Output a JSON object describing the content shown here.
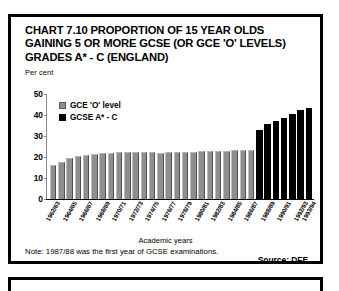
{
  "title": {
    "line1": "CHART 7.10 PROPORTION OF 15 YEAR OLDS",
    "line2": "GAINING 5 OR MORE GCSE (OR GCE 'O' LEVELS)",
    "line3": "GRADES A* - C (ENGLAND)"
  },
  "axis_unit_label": "Per cent",
  "x_axis_title": "Academic years",
  "note": "Note: 1987/88 was the first year of GCSE examinations.",
  "source": "Source: DFE",
  "legend": {
    "items": [
      {
        "label": "GCE 'O' level",
        "color": "#8e8e8e",
        "key": "gce"
      },
      {
        "label": "GCSE A* - C",
        "color": "#000000",
        "key": "gcse"
      }
    ]
  },
  "chart_data": {
    "type": "bar",
    "title": "CHART 7.10 PROPORTION OF 15 YEAR OLDS GAINING 5 OR MORE GCSE (OR GCE 'O' LEVELS) GRADES A* - C (ENGLAND)",
    "xlabel": "Academic years",
    "ylabel": "Per cent",
    "ylim": [
      0,
      50
    ],
    "yticks": [
      0,
      10,
      20,
      30,
      40,
      50
    ],
    "grid": false,
    "legend_position": "upper-left-inside",
    "categories": [
      "1962/63",
      "1963/64",
      "1964/65",
      "1965/66",
      "1966/67",
      "1967/68",
      "1968/69",
      "1969/70",
      "1970/71",
      "1971/72",
      "1972/73",
      "1973/74",
      "1974/75",
      "1975/76",
      "1976/77",
      "1977/78",
      "1978/79",
      "1979/80",
      "1980/81",
      "1981/82",
      "1982/83",
      "1983/84",
      "1984/85",
      "1985/86",
      "1986/87",
      "1987/88",
      "1988/89",
      "1989/90",
      "1990/91",
      "1991/92",
      "1992/93",
      "1993/94"
    ],
    "tick_labels_shown": [
      "1962/63",
      "1964/65",
      "1966/67",
      "1968/69",
      "1970/71",
      "1972/73",
      "1974/75",
      "1976/77",
      "1978/79",
      "1980/81",
      "1982/83",
      "1984/85",
      "1986/87",
      "1988/89",
      "1990/91",
      "1992/93",
      "1993/94"
    ],
    "series": [
      {
        "name": "GCE 'O' level",
        "color": "#8e8e8e",
        "values": [
          16.0,
          17.8,
          19.4,
          20.4,
          21.0,
          21.4,
          21.9,
          22.1,
          22.2,
          22.2,
          22.3,
          22.3,
          22.2,
          22.0,
          22.2,
          22.3,
          22.4,
          22.6,
          22.8,
          23.0,
          23.1,
          23.0,
          23.2,
          23.2,
          23.2,
          null,
          null,
          null,
          null,
          null,
          null,
          null
        ]
      },
      {
        "name": "GCSE A* - C",
        "color": "#000000",
        "values": [
          null,
          null,
          null,
          null,
          null,
          null,
          null,
          null,
          null,
          null,
          null,
          null,
          null,
          null,
          null,
          null,
          null,
          null,
          null,
          null,
          null,
          null,
          null,
          null,
          null,
          33.0,
          35.5,
          37.0,
          38.5,
          40.5,
          42.5,
          43.5
        ]
      }
    ]
  }
}
